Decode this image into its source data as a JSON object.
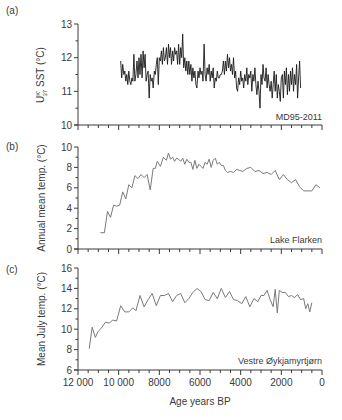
{
  "figure": {
    "x_axis": {
      "label": "Age years BP",
      "min": 12000,
      "max": 0,
      "major_ticks": [
        12000,
        10000,
        8000,
        6000,
        4000,
        2000,
        0
      ],
      "tick_labels": [
        "12 000",
        "10 000",
        "8000",
        "6000",
        "4000",
        "2000",
        "0"
      ],
      "minor_step": 500
    },
    "panels": [
      {
        "id": "a",
        "panel_label": "(a)",
        "ylabel_main": "U",
        "ylabel_sup": "K'",
        "ylabel_sub": "37",
        "ylabel_rest": " SST (°C)",
        "record_label": "MD95-2011",
        "ylim": [
          10,
          13
        ],
        "yticks": [
          10,
          11,
          12,
          13
        ],
        "line_color": "#1a1a1a"
      },
      {
        "id": "b",
        "panel_label": "(b)",
        "ylabel": "Annual mean temp. (°C)",
        "record_label": "Lake Flarken",
        "ylim": [
          0,
          10
        ],
        "yticks": [
          0,
          2,
          4,
          6,
          8,
          10
        ],
        "line_color": "#7a7a7a"
      },
      {
        "id": "c",
        "panel_label": "(c)",
        "ylabel": "Mean July temp. (°C)",
        "record_label": "Vestre Øykjamyrtjørn",
        "ylim": [
          6,
          16
        ],
        "yticks": [
          6,
          8,
          10,
          12,
          14,
          16
        ],
        "line_color": "#7a7a7a"
      }
    ]
  },
  "chart_data": [
    {
      "type": "line",
      "title": "(a) MD95-2011",
      "xlabel": "Age years BP",
      "ylabel": "U37K' SST (°C)",
      "xlim": [
        12000,
        0
      ],
      "ylim": [
        10,
        13
      ],
      "grid": false,
      "series": [
        {
          "name": "MD95-2011",
          "x": [
            9900,
            9850,
            9800,
            9750,
            9700,
            9650,
            9600,
            9550,
            9500,
            9450,
            9400,
            9350,
            9300,
            9250,
            9200,
            9150,
            9100,
            9050,
            9000,
            8950,
            8900,
            8850,
            8800,
            8750,
            8700,
            8650,
            8600,
            8550,
            8500,
            8450,
            8400,
            8350,
            8300,
            8250,
            8200,
            8150,
            8100,
            8050,
            8000,
            7950,
            7900,
            7850,
            7800,
            7750,
            7700,
            7650,
            7600,
            7550,
            7500,
            7450,
            7400,
            7350,
            7300,
            7250,
            7200,
            7150,
            7100,
            7050,
            7000,
            6950,
            6900,
            6850,
            6800,
            6750,
            6700,
            6650,
            6600,
            6550,
            6500,
            6450,
            6400,
            6350,
            6300,
            6250,
            6200,
            6150,
            6100,
            6050,
            6000,
            5950,
            5900,
            5850,
            5800,
            5750,
            5700,
            5650,
            5600,
            5550,
            5500,
            5450,
            5400,
            5350,
            5300,
            5250,
            5200,
            5150,
            5100,
            5050,
            5000,
            4950,
            4900,
            4850,
            4800,
            4750,
            4700,
            4650,
            4600,
            4550,
            4500,
            4450,
            4400,
            4350,
            4300,
            4250,
            4200,
            4150,
            4100,
            4050,
            4000,
            3950,
            3900,
            3850,
            3800,
            3750,
            3700,
            3650,
            3600,
            3550,
            3500,
            3450,
            3400,
            3350,
            3300,
            3250,
            3200,
            3150,
            3100,
            3050,
            3000,
            2950,
            2900,
            2850,
            2800,
            2750,
            2700,
            2650,
            2600,
            2550,
            2500,
            2450,
            2400,
            2350,
            2300,
            2250,
            2200,
            2150,
            2100,
            2050,
            2000,
            1950,
            1900,
            1850,
            1800,
            1750,
            1700,
            1650,
            1600,
            1550,
            1500,
            1450,
            1400,
            1350,
            1300,
            1250,
            1200,
            1150,
            1100,
            1050,
            1000,
            950,
            900,
            850,
            800,
            750
          ],
          "values": [
            11.9,
            11.4,
            11.8,
            11.5,
            11.6,
            11.3,
            11.5,
            11.2,
            11.6,
            11.3,
            11.2,
            11.4,
            11.3,
            12.1,
            11.3,
            11.5,
            11.9,
            11.4,
            12.0,
            11.5,
            12.1,
            11.4,
            12.2,
            11.7,
            12.1,
            11.3,
            11.5,
            11.6,
            10.8,
            11.5,
            11.3,
            11.4,
            11.1,
            11.6,
            11.5,
            11.8,
            12.0,
            11.2,
            12.0,
            11.9,
            12.2,
            11.8,
            12.3,
            11.9,
            12.0,
            12.3,
            11.8,
            12.4,
            12.0,
            12.3,
            11.8,
            12.2,
            11.9,
            12.3,
            12.1,
            12.2,
            11.8,
            12.4,
            11.8,
            12.3,
            12.0,
            12.7,
            11.7,
            12.0,
            11.6,
            11.9,
            11.5,
            11.9,
            11.5,
            11.8,
            11.3,
            11.7,
            11.4,
            11.6,
            11.2,
            11.1,
            11.6,
            11.4,
            11.7,
            11.5,
            11.6,
            11.3,
            12.4,
            11.5,
            11.3,
            11.7,
            11.5,
            11.8,
            11.3,
            11.6,
            11.4,
            11.7,
            11.1,
            11.4,
            11.3,
            11.6,
            11.4,
            11.4,
            11.5,
            11.5,
            11.6,
            11.9,
            11.5,
            11.9,
            11.6,
            12.1,
            11.7,
            12.0,
            11.6,
            11.8,
            11.5,
            12.0,
            11.4,
            11.6,
            11.1,
            11.0,
            11.4,
            11.2,
            11.6,
            11.3,
            11.4,
            11.1,
            11.5,
            11.3,
            11.7,
            11.2,
            11.5,
            11.4,
            11.6,
            11.0,
            11.5,
            11.3,
            11.7,
            11.2,
            10.9,
            11.3,
            11.0,
            10.5,
            11.5,
            11.2,
            11.8,
            11.4,
            11.3,
            11.7,
            11.1,
            11.5,
            11.2,
            11.0,
            11.3,
            10.8,
            11.2,
            11.6,
            11.0,
            11.5,
            10.8,
            11.2,
            11.0,
            10.7,
            11.4,
            11.5,
            10.8,
            11.6,
            11.2,
            11.7,
            10.9,
            11.5,
            11.0,
            11.6,
            11.2,
            11.7,
            11.0,
            11.5,
            11.2,
            11.8,
            10.8,
            11.4,
            11.9,
            11.1
          ]
        }
      ]
    },
    {
      "type": "line",
      "title": "(b) Lake Flarken",
      "xlabel": "Age years BP",
      "ylabel": "Annual mean temp. (°C)",
      "xlim": [
        12000,
        0
      ],
      "ylim": [
        0,
        10
      ],
      "grid": false,
      "series": [
        {
          "name": "Lake Flarken",
          "x": [
            10900,
            10700,
            10550,
            10400,
            10250,
            10100,
            9950,
            9800,
            9650,
            9500,
            9350,
            9200,
            9050,
            8900,
            8750,
            8600,
            8450,
            8300,
            8200,
            8100,
            7950,
            7800,
            7650,
            7550,
            7450,
            7350,
            7250,
            7150,
            7050,
            6950,
            6850,
            6750,
            6650,
            6550,
            6450,
            6350,
            6250,
            6150,
            6050,
            5950,
            5850,
            5750,
            5650,
            5550,
            5450,
            5350,
            5250,
            5150,
            5050,
            4950,
            4850,
            4750,
            4650,
            4500,
            4350,
            4200,
            4050,
            3900,
            3700,
            3500,
            3300,
            3100,
            2900,
            2700,
            2500,
            2300,
            2100,
            1900,
            1700,
            1500,
            1300,
            1100,
            900,
            700,
            500,
            300,
            100
          ],
          "values": [
            1.6,
            1.6,
            3.7,
            3.1,
            4.3,
            4.2,
            4.3,
            5.6,
            4.9,
            6.3,
            6.0,
            7.2,
            6.9,
            7.3,
            7.0,
            7.3,
            5.8,
            7.9,
            7.9,
            8.6,
            8.1,
            9.0,
            8.7,
            9.4,
            8.8,
            9.0,
            8.6,
            8.9,
            8.8,
            8.6,
            8.9,
            8.3,
            8.8,
            8.5,
            8.5,
            7.8,
            8.7,
            7.9,
            8.3,
            8.1,
            7.9,
            8.5,
            8.3,
            8.8,
            8.0,
            8.7,
            8.9,
            8.3,
            8.5,
            8.2,
            8.2,
            7.7,
            7.5,
            7.6,
            7.5,
            7.8,
            7.7,
            7.6,
            7.9,
            8.0,
            7.6,
            7.7,
            7.4,
            7.5,
            7.3,
            7.7,
            6.8,
            7.3,
            6.8,
            6.5,
            6.8,
            6.1,
            5.7,
            5.7,
            5.7,
            6.3,
            6.0
          ]
        }
      ]
    },
    {
      "type": "line",
      "title": "(c) Vestre Øykjamyrtjørn",
      "xlabel": "Age years BP",
      "ylabel": "Mean July temp. (°C)",
      "xlim": [
        12000,
        0
      ],
      "ylim": [
        6,
        16
      ],
      "grid": false,
      "series": [
        {
          "name": "Vestre Øykjamyrtjørn",
          "x": [
            11450,
            11300,
            11150,
            11000,
            10850,
            10650,
            10450,
            10300,
            10100,
            9900,
            9700,
            9500,
            9300,
            9150,
            8950,
            8750,
            8550,
            8350,
            8150,
            7950,
            7750,
            7550,
            7350,
            7150,
            6950,
            6750,
            6550,
            6350,
            6150,
            5950,
            5750,
            5550,
            5350,
            5150,
            4950,
            4750,
            4550,
            4350,
            4150,
            3950,
            3750,
            3550,
            3350,
            3150,
            3000,
            2850,
            2700,
            2550,
            2400,
            2300,
            2200,
            2100,
            1950,
            1800,
            1650,
            1500,
            1350,
            1200,
            1050,
            900,
            800,
            700,
            600,
            500
          ],
          "values": [
            8.1,
            10.2,
            9.2,
            9.8,
            10.1,
            10.7,
            10.6,
            10.9,
            10.8,
            12.3,
            11.7,
            11.7,
            12.1,
            11.8,
            13.3,
            12.2,
            12.9,
            13.5,
            12.3,
            13.3,
            13.3,
            13.5,
            12.7,
            13.3,
            13.5,
            12.6,
            13.0,
            13.6,
            14.0,
            13.7,
            12.9,
            12.8,
            13.6,
            13.0,
            14.0,
            13.1,
            13.7,
            12.9,
            12.8,
            12.5,
            13.2,
            12.2,
            13.0,
            12.7,
            13.3,
            13.3,
            13.8,
            12.9,
            12.2,
            13.9,
            11.6,
            13.8,
            13.6,
            13.6,
            13.2,
            13.3,
            13.1,
            13.4,
            12.9,
            13.0,
            12.0,
            12.5,
            11.7,
            12.6
          ]
        }
      ]
    }
  ]
}
